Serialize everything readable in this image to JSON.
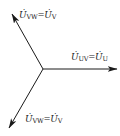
{
  "diagram": {
    "type": "phasor-diagram",
    "origin": [
      43,
      69
    ],
    "phasors": [
      {
        "id": "upper-left",
        "tip": [
          12,
          14
        ],
        "label": {
          "symbol": "U̇",
          "sub1": "VW",
          "eq": "=",
          "symbol2": "U̇",
          "sub2": "V"
        },
        "label_pos": [
          19,
          10
        ]
      },
      {
        "id": "right",
        "tip": [
          117,
          69
        ],
        "label": {
          "symbol": "U̇",
          "sub1": "UV",
          "eq": "=",
          "symbol2": "U̇",
          "sub2": "U"
        },
        "label_pos": [
          71,
          52
        ]
      },
      {
        "id": "lower-left",
        "tip": [
          9,
          128
        ],
        "label": {
          "symbol": "U̇",
          "sub1": "VW",
          "eq": "=",
          "symbol2": "U̇",
          "sub2": "V"
        },
        "label_pos": [
          25,
          114
        ]
      }
    ],
    "colors": {
      "line": "#1a1a1a",
      "background": "#ffffff"
    }
  }
}
